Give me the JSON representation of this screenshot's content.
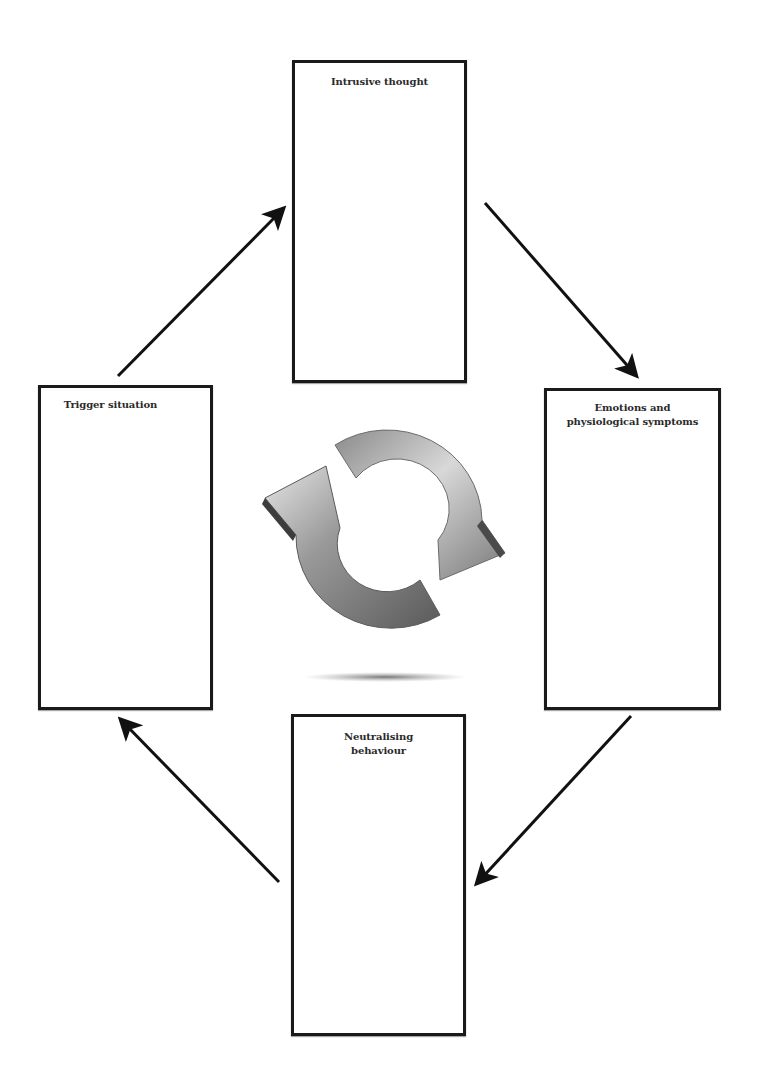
{
  "diagram": {
    "type": "cycle",
    "direction": "clockwise",
    "boxes": [
      {
        "id": "intrusive",
        "label": "Intrusive thought",
        "position": "top"
      },
      {
        "id": "emotions",
        "label": "Emotions and\nphysiological symptoms",
        "position": "right"
      },
      {
        "id": "neutral",
        "label": "Neutralising\nbehaviour",
        "position": "bottom"
      },
      {
        "id": "trigger",
        "label": "Trigger situation",
        "position": "left"
      }
    ],
    "arrows": [
      {
        "from": "trigger",
        "to": "intrusive"
      },
      {
        "from": "intrusive",
        "to": "emotions"
      },
      {
        "from": "emotions",
        "to": "neutral"
      },
      {
        "from": "neutral",
        "to": "trigger"
      }
    ],
    "center_icon": "cycle-arrows-icon",
    "colors": {
      "border": "#1a1a1a",
      "arrow": "#111111",
      "icon_light": "#d9d9d9",
      "icon_dark": "#555555"
    }
  }
}
